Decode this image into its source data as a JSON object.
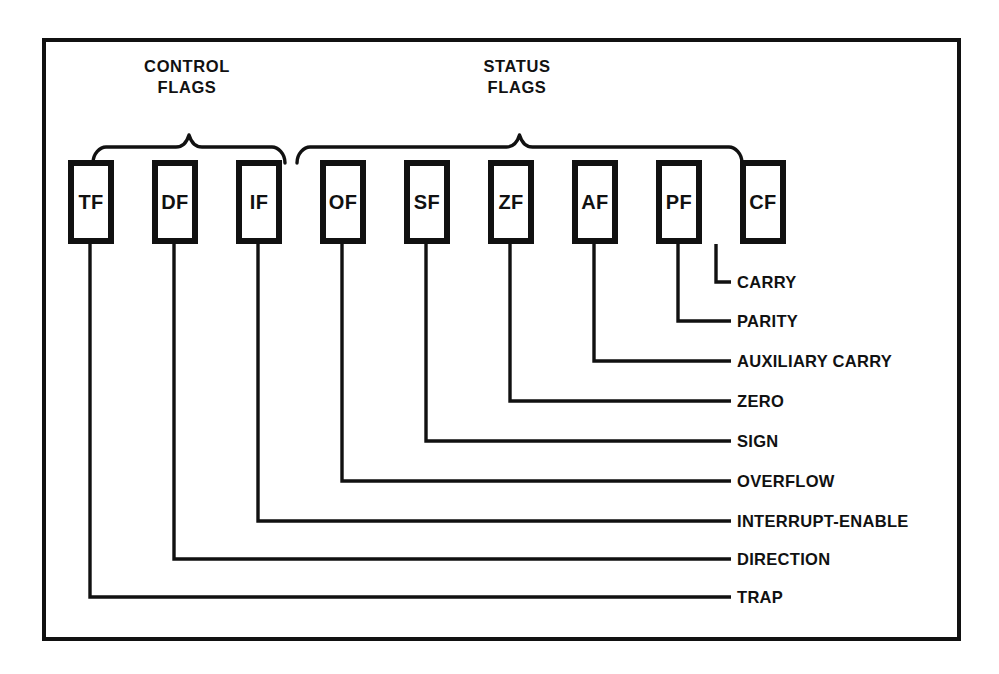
{
  "diagram": {
    "colors": {
      "ink": "#111111",
      "paper": "#ffffff",
      "frame": "#111111"
    },
    "frame": {
      "x": 42,
      "y": 38,
      "width": 919,
      "height": 603,
      "stroke_width": 4
    },
    "groups": [
      {
        "id": "control",
        "title_line1": "CONTROL",
        "title_line2": "FLAGS",
        "title_cx": 187,
        "title_y1": 72,
        "title_y2": 93,
        "brace_left": 93,
        "brace_right": 285,
        "brace_y": 147,
        "flag_count": 3
      },
      {
        "id": "status",
        "title_line1": "STATUS",
        "title_line2": "FLAGS",
        "title_cx": 517,
        "title_y1": 72,
        "title_y2": 93,
        "brace_left": 297,
        "brace_right": 742,
        "brace_y": 147,
        "flag_count": 6
      }
    ],
    "box_geometry": {
      "top": 160,
      "height": 84,
      "width": 46,
      "pitch": 84,
      "first_left": 68,
      "border_width": 6
    },
    "leader_geometry": {
      "stub_thickness": 3,
      "label_line_end_x": 731,
      "label_text_x": 737
    },
    "flags": [
      {
        "abbr": "TF",
        "name": "TRAP",
        "box_left": 68,
        "stub_x": 90,
        "label_y": 597
      },
      {
        "abbr": "DF",
        "name": "DIRECTION",
        "box_left": 152,
        "stub_x": 174,
        "label_y": 559
      },
      {
        "abbr": "IF",
        "name": "INTERRUPT-ENABLE",
        "box_left": 236,
        "stub_x": 258,
        "label_y": 521
      },
      {
        "abbr": "OF",
        "name": "OVERFLOW",
        "box_left": 320,
        "stub_x": 342,
        "label_y": 481
      },
      {
        "abbr": "SF",
        "name": "SIGN",
        "box_left": 404,
        "stub_x": 426,
        "label_y": 441
      },
      {
        "abbr": "ZF",
        "name": "ZERO",
        "box_left": 488,
        "stub_x": 510,
        "label_y": 401
      },
      {
        "abbr": "AF",
        "name": "AUXILIARY CARRY",
        "box_left": 572,
        "stub_x": 594,
        "label_y": 361
      },
      {
        "abbr": "PF",
        "name": "PARITY",
        "box_left": 656,
        "stub_x": 678,
        "label_y": 321
      },
      {
        "abbr": "CF",
        "name": "CARRY",
        "box_left": 740,
        "stub_x": 716,
        "label_y": 282
      }
    ]
  }
}
